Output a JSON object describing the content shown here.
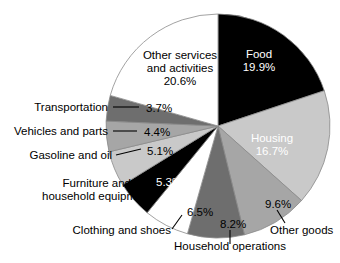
{
  "chart_data": {
    "type": "pie",
    "title": "",
    "subtitle": "",
    "xlabel": "",
    "ylabel": "",
    "legend_position": "none",
    "grid": false,
    "units": "percent",
    "start_angle_deg": 0,
    "direction": "clockwise",
    "categories": [
      "Food",
      "Housing",
      "Other goods",
      "Household operations",
      "Clothing and shoes",
      "Furniture and household equipment",
      "Gasoline and oil",
      "Vehicles and parts",
      "Transportation",
      "Other services and activities"
    ],
    "values": [
      19.9,
      16.7,
      9.6,
      8.2,
      6.5,
      5.3,
      5.1,
      4.4,
      3.7,
      20.6
    ],
    "value_labels": [
      "19.9%",
      "16.7%",
      "9.6%",
      "8.2%",
      "6.5%",
      "5.3%",
      "5.1%",
      "4.4%",
      "3.7%",
      "20.6%"
    ],
    "colors": [
      "#000000",
      "#c9c9c9",
      "#a6a6a6",
      "#6e6e6e",
      "#ffffff",
      "#000000",
      "#c9c9c9",
      "#a6a6a6",
      "#6e6e6e",
      "#ffffff"
    ],
    "label_placement": [
      "inside",
      "inside",
      "outside",
      "outside",
      "outside",
      "outside",
      "outside",
      "outside",
      "outside",
      "inside"
    ]
  },
  "slices": [
    {
      "name": "food",
      "category": "Food",
      "percent_text": "19.9%",
      "color": "#000000",
      "text_color": "#ffffff",
      "name_line_1": "Food",
      "name_line_2": ""
    },
    {
      "name": "housing",
      "category": "Housing",
      "percent_text": "16.7%",
      "color": "#c9c9c9",
      "text_color": "#ffffff",
      "name_line_1": "Housing",
      "name_line_2": ""
    },
    {
      "name": "other-goods",
      "category": "Other goods",
      "percent_text": "9.6%",
      "color": "#a6a6a6",
      "text_color": "#000000",
      "name_line_1": "Other goods",
      "name_line_2": ""
    },
    {
      "name": "household-operations",
      "category": "Household operations",
      "percent_text": "8.2%",
      "color": "#6e6e6e",
      "text_color": "#000000",
      "name_line_1": "Household operations",
      "name_line_2": ""
    },
    {
      "name": "clothing-and-shoes",
      "category": "Clothing and shoes",
      "percent_text": "6.5%",
      "color": "#ffffff",
      "text_color": "#000000",
      "name_line_1": "Clothing and shoes",
      "name_line_2": ""
    },
    {
      "name": "furniture-and-household-equipment",
      "category": "Furniture and household equipment",
      "percent_text": "5.3%",
      "color": "#000000",
      "text_color": "#ffffff",
      "name_line_1": "Furniture and",
      "name_line_2": "household equipment"
    },
    {
      "name": "gasoline-and-oil",
      "category": "Gasoline and oil",
      "percent_text": "5.1%",
      "color": "#c9c9c9",
      "text_color": "#000000",
      "name_line_1": "Gasoline and oil",
      "name_line_2": ""
    },
    {
      "name": "vehicles-and-parts",
      "category": "Vehicles and parts",
      "percent_text": "4.4%",
      "color": "#a6a6a6",
      "text_color": "#000000",
      "name_line_1": "Vehicles and parts",
      "name_line_2": ""
    },
    {
      "name": "transportation",
      "category": "Transportation",
      "percent_text": "3.7%",
      "color": "#6e6e6e",
      "text_color": "#000000",
      "name_line_1": "Transportation",
      "name_line_2": ""
    },
    {
      "name": "other-services-and-activities",
      "category": "Other services and activities",
      "percent_text": "20.6%",
      "color": "#ffffff",
      "text_color": "#000000",
      "name_line_1": "Other services",
      "name_line_2": "and activities"
    }
  ]
}
